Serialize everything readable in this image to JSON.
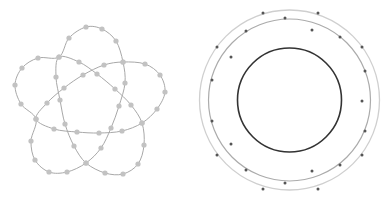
{
  "figures": {
    "left": {
      "name": "five-lobed-knot",
      "line_color": "#a8a8a8",
      "node_color": "#c2c2c2",
      "node_radius": 2.6,
      "loops": [
        [
          [
            36,
            119
          ],
          [
            54,
            129
          ],
          [
            77,
            132
          ],
          [
            99,
            133
          ],
          [
            122,
            131
          ],
          [
            142,
            123
          ],
          [
            157,
            109
          ],
          [
            165,
            92
          ],
          [
            160,
            75
          ],
          [
            145,
            64
          ],
          [
            123,
            62
          ],
          [
            104,
            65
          ],
          [
            83,
            75
          ],
          [
            64,
            88
          ],
          [
            47,
            103
          ]
        ],
        [
          [
            142,
            123
          ],
          [
            144,
            145
          ],
          [
            138,
            164
          ],
          [
            123,
            174
          ],
          [
            105,
            173
          ],
          [
            86,
            163
          ],
          [
            74,
            146
          ],
          [
            65,
            124
          ],
          [
            60,
            100
          ],
          [
            56,
            77
          ],
          [
            59,
            57
          ],
          [
            79,
            62
          ],
          [
            97,
            74
          ],
          [
            115,
            89
          ],
          [
            131,
            105
          ]
        ],
        [
          [
            86,
            163
          ],
          [
            101,
            148
          ],
          [
            111,
            128
          ],
          [
            119,
            106
          ],
          [
            125,
            83
          ],
          [
            123,
            62
          ],
          [
            116,
            41
          ],
          [
            102,
            29
          ],
          [
            86,
            27
          ],
          [
            69,
            38
          ],
          [
            59,
            57
          ],
          [
            38,
            58
          ],
          [
            22,
            68
          ],
          [
            15,
            85
          ],
          [
            21,
            104
          ],
          [
            36,
            119
          ],
          [
            31,
            141
          ],
          [
            35,
            160
          ],
          [
            49,
            172
          ],
          [
            67,
            172
          ]
        ]
      ],
      "extra_nodes": []
    },
    "right": {
      "name": "concentric-rings",
      "center": [
        289.5,
        100
      ],
      "rings": [
        {
          "r": 90,
          "color": "#cfcfcf",
          "width": 1.3
        },
        {
          "r": 81,
          "color": "#ababab",
          "width": 1.2
        },
        {
          "r": 52,
          "color": "#333333",
          "width": 1.6
        }
      ],
      "dot_color": "#555555",
      "dot_radius": 1.5,
      "dots": [
        [
          263,
          13
        ],
        [
          318,
          13
        ],
        [
          285,
          18
        ],
        [
          246,
          31
        ],
        [
          312,
          30
        ],
        [
          340,
          37
        ],
        [
          217,
          47
        ],
        [
          362,
          47
        ],
        [
          231,
          57
        ],
        [
          365,
          71
        ],
        [
          212,
          80
        ],
        [
          362,
          101
        ],
        [
          212,
          121
        ],
        [
          365,
          131
        ],
        [
          231,
          144
        ],
        [
          217,
          155
        ],
        [
          362,
          155
        ],
        [
          340,
          165
        ],
        [
          246,
          170
        ],
        [
          312,
          171
        ],
        [
          285,
          183
        ],
        [
          263,
          189
        ],
        [
          318,
          189
        ]
      ]
    }
  }
}
